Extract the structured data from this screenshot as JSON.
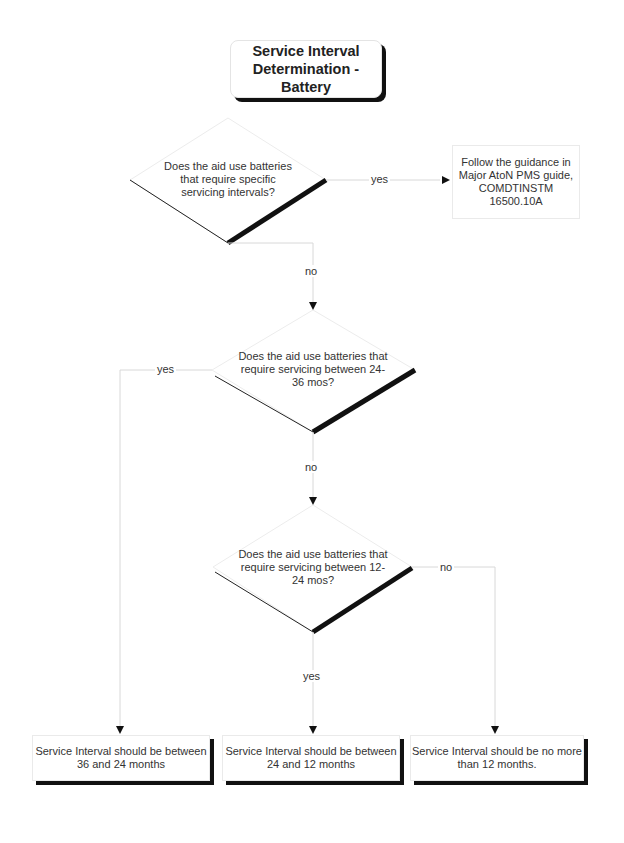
{
  "title": "Service Interval Determination - Battery",
  "decisions": [
    {
      "id": "d1",
      "text": "Does the aid use batteries that require specific servicing intervals?"
    },
    {
      "id": "d2",
      "text": "Does the aid use batteries that require servicing between 24-36 mos?"
    },
    {
      "id": "d3",
      "text": "Does the aid use batteries that require servicing between 12-24 mos?"
    }
  ],
  "processes": [
    {
      "id": "p1",
      "text": "Follow the guidance in Major AtoN PMS guide, COMDTINSTM 16500.10A"
    }
  ],
  "outcomes": [
    {
      "id": "o1",
      "text": "Service Interval should be between 36 and 24 months"
    },
    {
      "id": "o2",
      "text": "Service Interval should be between 24 and 12  months"
    },
    {
      "id": "o3",
      "text": "Service Interval should be no more than 12 months."
    }
  ],
  "edge_labels": {
    "d1_yes": "yes",
    "d1_no": "no",
    "d2_yes": "yes",
    "d2_no": "no",
    "d3_yes": "yes",
    "d3_no": "no"
  },
  "colors": {
    "connector": "#d8d8d8",
    "shadow": "#111111",
    "outline": "#222222"
  }
}
